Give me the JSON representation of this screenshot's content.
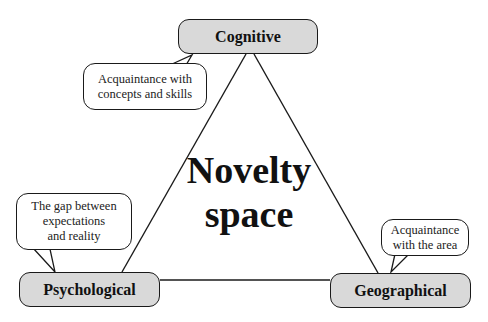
{
  "diagram": {
    "center_label": [
      "Novelty",
      "space"
    ],
    "nodes": {
      "cognitive": "Cognitive",
      "psychological": "Psychological",
      "geographical": "Geographical"
    },
    "callouts": {
      "cognitive": [
        "Acquaintance with",
        "concepts and skills"
      ],
      "psychological": [
        "The gap between",
        "expectations",
        "and reality"
      ],
      "geographical": [
        "Acquaintance",
        "with the area"
      ]
    },
    "colors": {
      "node_fill": "#d9d9d9",
      "stroke": "#1a1a1a",
      "callout_fill": "#ffffff"
    }
  }
}
